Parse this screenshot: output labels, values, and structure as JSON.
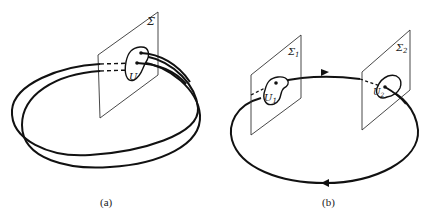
{
  "figure": {
    "panels": [
      {
        "id": "a",
        "caption": "(a)",
        "section_label": "Σ",
        "region_label": "U",
        "description": "Closed orbit winding twice around, crossing a transversal section Σ at two points inside neighborhood U"
      },
      {
        "id": "b",
        "caption": "(b)",
        "section1_label": "Σ",
        "section1_subscript": "1",
        "section2_label": "Σ",
        "section2_subscript": "2",
        "region1_label": "U",
        "region1_subscript": "1",
        "region2_label": "U",
        "region2_subscript": "2",
        "description": "Closed orbit with direction arrows crossing two transversal sections Σ1 and Σ2 at neighborhoods U1 and U2"
      }
    ],
    "colors": {
      "stroke": "#111111",
      "plane": "#333333",
      "background": "#ffffff"
    }
  }
}
